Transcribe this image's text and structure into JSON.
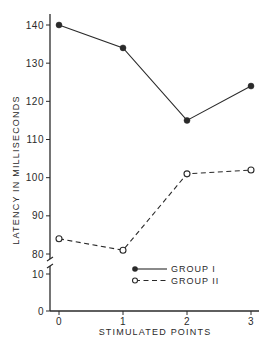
{
  "chart_data": {
    "type": "line",
    "title": "",
    "xlabel": "STIMULATED POINTS",
    "ylabel": "LATENCY IN MILLISECONDS",
    "x": [
      0,
      1,
      2,
      3
    ],
    "x_ticks": [
      "0",
      "1",
      "2",
      "3"
    ],
    "y_ticks_upper": [
      "80",
      "90",
      "100",
      "110",
      "120",
      "130",
      "140"
    ],
    "y_ticks_lower": [
      "0",
      "10"
    ],
    "axis_break": "between 10 and 80",
    "ylim": [
      0,
      143
    ],
    "grid": false,
    "legend_position": "lower center inside plot",
    "series": [
      {
        "name": "GROUP I",
        "values": [
          140,
          134,
          115,
          124
        ],
        "marker": "filled-circle",
        "line": "solid",
        "color": "#2a2a2a"
      },
      {
        "name": "GROUP II",
        "values": [
          84,
          81,
          101,
          102
        ],
        "marker": "open-circle",
        "line": "dashed",
        "color": "#2a2a2a"
      }
    ]
  }
}
